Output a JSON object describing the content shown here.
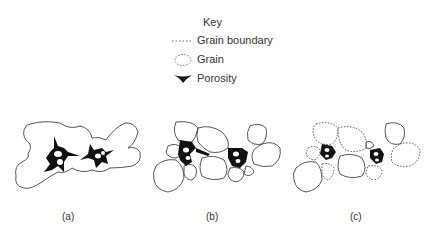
{
  "key": {
    "title": "Key",
    "items": [
      {
        "label": "Grain boundary",
        "symbol": "dotted-line"
      },
      {
        "label": "Grain",
        "symbol": "dashed-ellipse"
      },
      {
        "label": "Porosity",
        "symbol": "black-triangle"
      }
    ]
  },
  "panels": [
    {
      "id": "a",
      "caption": "(a)",
      "description": "Grains with large interconnected pore spaces"
    },
    {
      "id": "b",
      "caption": "(b)",
      "description": "Grains more compacted, reduced porosity"
    },
    {
      "id": "c",
      "caption": "(c)",
      "description": "Grains with dotted boundaries, minimal porosity"
    }
  ],
  "colors": {
    "outline": "#444444",
    "pore": "#111111",
    "text": "#333333"
  }
}
